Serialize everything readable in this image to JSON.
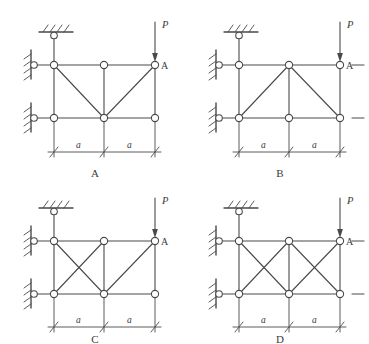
{
  "figure": {
    "type": "structural-truss-multiple-choice",
    "background_color": "#ffffff",
    "line_color": "#4a4a4a",
    "node_fill": "#ffffff",
    "text_color": "#3a3a3a",
    "panel_count": 4
  },
  "labels": {
    "load": "P",
    "joint": "A",
    "span_left": "a",
    "span_right": "a"
  },
  "options": [
    {
      "id": "A",
      "caption": "A",
      "load_label": "P",
      "joint_label": "A",
      "dim_left": "a",
      "dim_right": "a",
      "bracing": "V-shape: diagonals from top-left down to bottom-center and from bottom-center up to top-right",
      "left_panel_diagonals": 1,
      "right_panel_diagonals": 1,
      "supports": [
        "top-vertical-link-to-hatched-ceiling",
        "upper-left-horizontal-link-to-hatched-wall",
        "lower-left-horizontal-link-to-hatched-wall"
      ]
    },
    {
      "id": "B",
      "caption": "B",
      "load_label": "P",
      "joint_label": "A",
      "dim_left": "a",
      "dim_right": "a",
      "bracing": "Lambda-shape: diagonals from bottom-left up to top-center and from top-center down to bottom-right",
      "left_panel_diagonals": 1,
      "right_panel_diagonals": 1,
      "supports": [
        "top-vertical-link-to-hatched-ceiling",
        "upper-left-horizontal-link-to-hatched-wall",
        "lower-left-horizontal-link-to-hatched-wall"
      ]
    },
    {
      "id": "C",
      "caption": "C",
      "load_label": "P",
      "joint_label": "A",
      "dim_left": "a",
      "dim_right": "a",
      "bracing": "Left panel cross-braced (X); right panel single diagonal from bottom-center up to top-right",
      "left_panel_diagonals": 2,
      "right_panel_diagonals": 1,
      "supports": [
        "top-vertical-link-to-hatched-ceiling",
        "upper-left-horizontal-link-to-hatched-wall",
        "lower-left-horizontal-link-to-hatched-wall"
      ]
    },
    {
      "id": "D",
      "caption": "D",
      "load_label": "P",
      "joint_label": "A",
      "dim_left": "a",
      "dim_right": "a",
      "bracing": "Both panels cross-braced (X in left panel and X in right panel)",
      "left_panel_diagonals": 2,
      "right_panel_diagonals": 2,
      "supports": [
        "top-vertical-link-to-hatched-ceiling",
        "upper-left-horizontal-link-to-hatched-wall",
        "lower-left-horizontal-link-to-hatched-wall"
      ]
    }
  ]
}
